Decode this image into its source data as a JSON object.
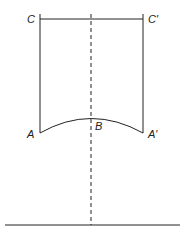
{
  "diagram": {
    "labels": {
      "C": "C",
      "C_prime": "C′",
      "A": "A",
      "B": "B",
      "A_prime": "A′"
    },
    "colors": {
      "stroke": "#222222",
      "background": "#ffffff"
    }
  }
}
